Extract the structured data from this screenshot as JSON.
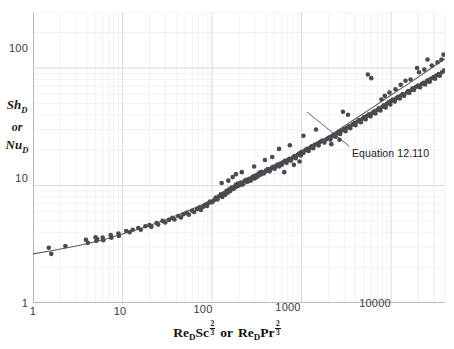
{
  "chart_data": {
    "type": "scatter",
    "title": "",
    "xlabel": "Re_D Sc^(2/3)  or  Re_D Pr^(2/3)",
    "ylabel": "Sh_D or Nu_D",
    "xscale": "log",
    "yscale": "log",
    "xlim": [
      1,
      40000
    ],
    "ylim": [
      1,
      300
    ],
    "xticks": [
      1,
      10,
      100,
      1000,
      10000
    ],
    "xtick_labels": [
      "1",
      "10",
      "100",
      "1000",
      "10000"
    ],
    "yticks": [
      1,
      10,
      100
    ],
    "ytick_labels": [
      "1",
      "10",
      "100"
    ],
    "grid": "minor-log-both-axes",
    "grid_color": "#e2e2e2",
    "point_color": "#4a4a50",
    "point_size": 2.3,
    "curve_color": "#5a5a5a",
    "curve_label": "Equation 12.110",
    "legend": "none",
    "annotations": [
      {
        "text": "Equation 12.110",
        "x_px": 352,
        "y_px": 147,
        "leader_from": [
          349,
          146
        ],
        "leader_to": [
          307,
          112
        ]
      }
    ],
    "curve": {
      "comment": "Fitted correlation Sh = 2 + c1*X^0.5 + c2*X^0.62 style; sampled as (x, y) pairs on log-log",
      "points": [
        [
          1.0,
          2.62
        ],
        [
          1.6,
          2.78
        ],
        [
          2.5,
          2.97
        ],
        [
          4.0,
          3.2
        ],
        [
          6.3,
          3.48
        ],
        [
          10,
          3.86
        ],
        [
          16,
          4.3
        ],
        [
          25,
          4.85
        ],
        [
          40,
          5.55
        ],
        [
          63,
          6.4
        ],
        [
          100,
          7.5
        ],
        [
          160,
          8.9
        ],
        [
          250,
          10.5
        ],
        [
          400,
          12.7
        ],
        [
          630,
          15.4
        ],
        [
          1000,
          19.0
        ],
        [
          1600,
          23.6
        ],
        [
          2500,
          29.3
        ],
        [
          4000,
          37.0
        ],
        [
          6300,
          46.5
        ],
        [
          10000,
          59.0
        ],
        [
          16000,
          74.5
        ],
        [
          25000,
          94.0
        ],
        [
          40000,
          120.0
        ]
      ]
    },
    "series": [
      {
        "name": "experimental data",
        "marker": "filled-circle",
        "points": [
          [
            1.5,
            2.95
          ],
          [
            1.6,
            2.62
          ],
          [
            2.3,
            3.05
          ],
          [
            3.9,
            3.45
          ],
          [
            4.1,
            3.25
          ],
          [
            5.0,
            3.62
          ],
          [
            5.1,
            3.38
          ],
          [
            5.2,
            3.5
          ],
          [
            6.0,
            3.6
          ],
          [
            6.1,
            3.42
          ],
          [
            7.4,
            3.78
          ],
          [
            7.5,
            3.6
          ],
          [
            9.0,
            3.9
          ],
          [
            9.1,
            3.72
          ],
          [
            11,
            4.1
          ],
          [
            12,
            4.0
          ],
          [
            13,
            4.2
          ],
          [
            15,
            4.35
          ],
          [
            16,
            4.2
          ],
          [
            18,
            4.5
          ],
          [
            20,
            4.6
          ],
          [
            21,
            4.45
          ],
          [
            24,
            4.8
          ],
          [
            25,
            4.65
          ],
          [
            28,
            5.0
          ],
          [
            30,
            4.85
          ],
          [
            33,
            5.1
          ],
          [
            36,
            5.3
          ],
          [
            38,
            5.15
          ],
          [
            42,
            5.5
          ],
          [
            45,
            5.35
          ],
          [
            48,
            5.7
          ],
          [
            52,
            5.85
          ],
          [
            55,
            5.65
          ],
          [
            60,
            6.1
          ],
          [
            63,
            5.95
          ],
          [
            68,
            6.3
          ],
          [
            72,
            6.5
          ],
          [
            75,
            6.2
          ],
          [
            80,
            6.6
          ],
          [
            85,
            6.9
          ],
          [
            88,
            6.7
          ],
          [
            92,
            7.1
          ],
          [
            95,
            7.3
          ],
          [
            100,
            7.2
          ],
          [
            105,
            7.5
          ],
          [
            110,
            7.9
          ],
          [
            115,
            7.6
          ],
          [
            120,
            8.1
          ],
          [
            125,
            8.4
          ],
          [
            130,
            8.0
          ],
          [
            135,
            8.6
          ],
          [
            140,
            8.3
          ],
          [
            145,
            9.0
          ],
          [
            150,
            8.7
          ],
          [
            155,
            9.3
          ],
          [
            160,
            9.0
          ],
          [
            165,
            9.6
          ],
          [
            170,
            11.8
          ],
          [
            175,
            9.4
          ],
          [
            180,
            9.8
          ],
          [
            185,
            10.2
          ],
          [
            190,
            9.9
          ],
          [
            195,
            10.4
          ],
          [
            200,
            10.1
          ],
          [
            210,
            10.6
          ],
          [
            220,
            10.2
          ],
          [
            230,
            10.9
          ],
          [
            240,
            11.2
          ],
          [
            250,
            10.8
          ],
          [
            260,
            11.4
          ],
          [
            270,
            11.0
          ],
          [
            280,
            11.7
          ],
          [
            290,
            12.0
          ],
          [
            300,
            11.5
          ],
          [
            310,
            12.2
          ],
          [
            320,
            11.9
          ],
          [
            330,
            12.6
          ],
          [
            340,
            12.9
          ],
          [
            350,
            12.4
          ],
          [
            360,
            13.1
          ],
          [
            380,
            12.7
          ],
          [
            400,
            13.4
          ],
          [
            420,
            13.8
          ],
          [
            440,
            13.2
          ],
          [
            460,
            14.0
          ],
          [
            480,
            14.4
          ],
          [
            500,
            13.9
          ],
          [
            520,
            14.7
          ],
          [
            540,
            15.1
          ],
          [
            560,
            14.5
          ],
          [
            580,
            15.4
          ],
          [
            600,
            15.0
          ],
          [
            620,
            15.8
          ],
          [
            650,
            16.2
          ],
          [
            680,
            15.6
          ],
          [
            700,
            16.5
          ],
          [
            730,
            16.9
          ],
          [
            760,
            16.3
          ],
          [
            800,
            17.3
          ],
          [
            830,
            17.8
          ],
          [
            860,
            17.1
          ],
          [
            900,
            18.2
          ],
          [
            940,
            18.7
          ],
          [
            980,
            18.0
          ],
          [
            1000,
            19.4
          ],
          [
            1050,
            18.9
          ],
          [
            1100,
            20.0
          ],
          [
            1150,
            20.5
          ],
          [
            1200,
            19.7
          ],
          [
            1250,
            21.0
          ],
          [
            1300,
            21.6
          ],
          [
            1350,
            20.8
          ],
          [
            1400,
            22.2
          ],
          [
            1500,
            22.8
          ],
          [
            1550,
            21.9
          ],
          [
            1600,
            23.4
          ],
          [
            1700,
            24.1
          ],
          [
            1800,
            23.2
          ],
          [
            1900,
            24.8
          ],
          [
            2000,
            25.5
          ],
          [
            2100,
            24.6
          ],
          [
            2200,
            26.3
          ],
          [
            2300,
            27.0
          ],
          [
            2400,
            26.0
          ],
          [
            2500,
            27.8
          ],
          [
            2600,
            28.6
          ],
          [
            2700,
            27.5
          ],
          [
            2800,
            29.4
          ],
          [
            3000,
            30.2
          ],
          [
            3100,
            29.0
          ],
          [
            3200,
            31.0
          ],
          [
            3400,
            32.0
          ],
          [
            3500,
            30.8
          ],
          [
            3700,
            33.0
          ],
          [
            3900,
            34.0
          ],
          [
            4000,
            32.6
          ],
          [
            4200,
            35.0
          ],
          [
            4400,
            36.0
          ],
          [
            4600,
            34.6
          ],
          [
            4800,
            37.0
          ],
          [
            5000,
            38.2
          ],
          [
            5200,
            36.6
          ],
          [
            5400,
            39.2
          ],
          [
            5700,
            40.4
          ],
          [
            5900,
            38.8
          ],
          [
            6200,
            41.5
          ],
          [
            6500,
            42.8
          ],
          [
            6700,
            41.0
          ],
          [
            7000,
            44.0
          ],
          [
            7300,
            45.4
          ],
          [
            7600,
            43.5
          ],
          [
            8000,
            46.8
          ],
          [
            8300,
            48.2
          ],
          [
            8700,
            46.2
          ],
          [
            9000,
            49.6
          ],
          [
            9400,
            51.0
          ],
          [
            9800,
            49.0
          ],
          [
            10000,
            52.5
          ],
          [
            10500,
            54.0
          ],
          [
            11000,
            52.0
          ],
          [
            11500,
            55.5
          ],
          [
            12000,
            57.0
          ],
          [
            12500,
            55.0
          ],
          [
            13000,
            58.6
          ],
          [
            13500,
            60.2
          ],
          [
            14000,
            58.0
          ],
          [
            15000,
            62.0
          ],
          [
            15500,
            63.8
          ],
          [
            16000,
            61.5
          ],
          [
            17000,
            65.5
          ],
          [
            17500,
            67.4
          ],
          [
            18000,
            65.0
          ],
          [
            19000,
            69.2
          ],
          [
            20000,
            71.0
          ],
          [
            21000,
            68.5
          ],
          [
            22000,
            73.0
          ],
          [
            23000,
            75.0
          ],
          [
            24000,
            72.5
          ],
          [
            25000,
            77.0
          ],
          [
            26000,
            79.2
          ],
          [
            27000,
            76.5
          ],
          [
            28000,
            81.5
          ],
          [
            30000,
            84.0
          ],
          [
            31000,
            81.0
          ],
          [
            32000,
            86.5
          ],
          [
            34000,
            89.0
          ],
          [
            35000,
            86.0
          ],
          [
            37000,
            92.0
          ],
          [
            39000,
            95.0
          ],
          [
            5500,
            88.0
          ],
          [
            6000,
            82.0
          ],
          [
            2900,
            42.5
          ],
          [
            3300,
            40.0
          ],
          [
            1450,
            30.0
          ],
          [
            1050,
            26.5
          ],
          [
            740,
            22.0
          ],
          [
            560,
            20.5
          ],
          [
            470,
            17.5
          ],
          [
            390,
            16.5
          ],
          [
            295,
            14.5
          ],
          [
            215,
            13.0
          ],
          [
            185,
            12.5
          ],
          [
            152,
            11.0
          ],
          [
            128,
            10.5
          ],
          [
            640,
            13.0
          ],
          [
            820,
            15.0
          ],
          [
            950,
            16.0
          ],
          [
            2150,
            22.5
          ],
          [
            2650,
            24.5
          ],
          [
            8500,
            58.0
          ],
          [
            9600,
            62.0
          ],
          [
            12800,
            72.0
          ],
          [
            16500,
            80.0
          ],
          [
            20500,
            92.0
          ],
          [
            23500,
            97.0
          ],
          [
            28500,
            105.0
          ],
          [
            33000,
            112.0
          ],
          [
            36500,
            118.0
          ],
          [
            38500,
            130.0
          ],
          [
            25500,
            118.0
          ],
          [
            19500,
            100.0
          ],
          [
            14500,
            78.0
          ],
          [
            11200,
            66.0
          ],
          [
            7800,
            54.0
          ]
        ]
      }
    ]
  },
  "axes": {
    "y_title_lines": [
      "Sh",
      "or",
      "Nu"
    ],
    "y_sub": "D",
    "x_title": {
      "re": "Re",
      "re_sub": "D",
      "sc": "Sc",
      "pr": "Pr",
      "or": "or",
      "exp_num": "2",
      "exp_den": "3"
    }
  }
}
